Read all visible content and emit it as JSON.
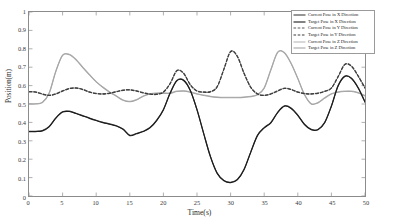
{
  "chart_data": {
    "type": "line",
    "title": "",
    "xlabel": "Time(s)",
    "ylabel": "Position(m)",
    "xlim": [
      0,
      50
    ],
    "ylim": [
      0,
      1
    ],
    "xticks": [
      0,
      5,
      10,
      15,
      20,
      25,
      30,
      35,
      40,
      45,
      50
    ],
    "yticks": [
      0,
      0.1,
      0.2,
      0.3,
      0.4,
      0.5,
      0.6,
      0.7,
      0.8,
      0.9,
      1
    ],
    "ytick_labels": [
      "0",
      "0.1",
      "0.2",
      "0.3",
      "0.4",
      "0.5",
      "0.6",
      "0.7",
      "0.8",
      "0.9",
      "1"
    ],
    "xtick_labels": [
      "0",
      "5",
      "10",
      "15",
      "20",
      "25",
      "30",
      "35",
      "40",
      "45",
      "50"
    ],
    "grid": false,
    "legend_position": "top-right",
    "x": [
      0,
      1,
      2,
      3,
      4,
      5,
      6,
      7,
      8,
      9,
      10,
      11,
      12,
      13,
      14,
      15,
      16,
      17,
      18,
      19,
      20,
      21,
      22,
      23,
      24,
      25,
      26,
      27,
      28,
      29,
      30,
      31,
      32,
      33,
      34,
      35,
      36,
      37,
      38,
      39,
      40,
      41,
      42,
      43,
      44,
      45,
      46,
      47,
      48,
      49,
      50
    ],
    "series": [
      {
        "name": "Current Pose in X Direction",
        "color": "#3f3f3f",
        "style": "solid",
        "values": [
          0.352,
          0.352,
          0.356,
          0.378,
          0.425,
          0.458,
          0.461,
          0.45,
          0.437,
          0.424,
          0.412,
          0.401,
          0.392,
          0.382,
          0.364,
          0.33,
          0.34,
          0.352,
          0.372,
          0.412,
          0.47,
          0.56,
          0.628,
          0.63,
          0.575,
          0.47,
          0.34,
          0.215,
          0.125,
          0.085,
          0.075,
          0.09,
          0.145,
          0.24,
          0.33,
          0.372,
          0.4,
          0.455,
          0.49,
          0.478,
          0.44,
          0.39,
          0.362,
          0.362,
          0.4,
          0.49,
          0.6,
          0.652,
          0.64,
          0.588,
          0.512
        ]
      },
      {
        "name": "Target Pose in X Direction",
        "color": "#1c1c1c",
        "style": "solid",
        "values": [
          0.35,
          0.35,
          0.354,
          0.376,
          0.423,
          0.456,
          0.459,
          0.448,
          0.435,
          0.422,
          0.41,
          0.399,
          0.39,
          0.38,
          0.362,
          0.328,
          0.338,
          0.35,
          0.37,
          0.41,
          0.468,
          0.558,
          0.626,
          0.628,
          0.573,
          0.468,
          0.338,
          0.213,
          0.123,
          0.083,
          0.073,
          0.088,
          0.143,
          0.238,
          0.328,
          0.37,
          0.398,
          0.453,
          0.488,
          0.476,
          0.438,
          0.388,
          0.36,
          0.36,
          0.398,
          0.488,
          0.598,
          0.65,
          0.638,
          0.586,
          0.51
        ]
      },
      {
        "name": "Current Pose in Y Direction",
        "color": "#5a5a5a",
        "style": "dashed",
        "values": [
          0.568,
          0.566,
          0.555,
          0.548,
          0.556,
          0.572,
          0.585,
          0.588,
          0.58,
          0.566,
          0.558,
          0.556,
          0.56,
          0.568,
          0.576,
          0.578,
          0.572,
          0.562,
          0.555,
          0.554,
          0.566,
          0.612,
          0.682,
          0.668,
          0.606,
          0.572,
          0.566,
          0.568,
          0.595,
          0.69,
          0.786,
          0.76,
          0.668,
          0.592,
          0.556,
          0.548,
          0.556,
          0.572,
          0.586,
          0.58,
          0.566,
          0.558,
          0.556,
          0.56,
          0.57,
          0.588,
          0.65,
          0.716,
          0.706,
          0.652,
          0.588
        ]
      },
      {
        "name": "Target Pose in Y Direction",
        "color": "#3d3d3d",
        "style": "dashed",
        "values": [
          0.566,
          0.564,
          0.553,
          0.546,
          0.554,
          0.57,
          0.583,
          0.586,
          0.578,
          0.564,
          0.556,
          0.554,
          0.558,
          0.566,
          0.574,
          0.576,
          0.57,
          0.56,
          0.553,
          0.552,
          0.564,
          0.61,
          0.68,
          0.666,
          0.604,
          0.57,
          0.564,
          0.566,
          0.593,
          0.688,
          0.784,
          0.758,
          0.666,
          0.59,
          0.554,
          0.546,
          0.554,
          0.57,
          0.584,
          0.578,
          0.564,
          0.556,
          0.554,
          0.558,
          0.568,
          0.586,
          0.648,
          0.714,
          0.704,
          0.65,
          0.586
        ]
      },
      {
        "name": "Current Pose in Z Direction",
        "color": "#b8b8b8",
        "style": "solid",
        "values": [
          0.502,
          0.502,
          0.51,
          0.56,
          0.68,
          0.766,
          0.77,
          0.742,
          0.7,
          0.66,
          0.622,
          0.592,
          0.566,
          0.544,
          0.522,
          0.514,
          0.524,
          0.544,
          0.556,
          0.56,
          0.56,
          0.56,
          0.57,
          0.572,
          0.566,
          0.556,
          0.548,
          0.542,
          0.538,
          0.536,
          0.536,
          0.536,
          0.538,
          0.542,
          0.552,
          0.588,
          0.688,
          0.782,
          0.78,
          0.722,
          0.64,
          0.552,
          0.502,
          0.508,
          0.534,
          0.556,
          0.566,
          0.57,
          0.57,
          0.562,
          0.546
        ]
      },
      {
        "name": "Target Pose in Z Direction",
        "color": "#a6a6a6",
        "style": "solid",
        "values": [
          0.5,
          0.5,
          0.508,
          0.558,
          0.678,
          0.764,
          0.768,
          0.74,
          0.698,
          0.658,
          0.62,
          0.59,
          0.564,
          0.542,
          0.52,
          0.512,
          0.522,
          0.542,
          0.554,
          0.558,
          0.558,
          0.558,
          0.568,
          0.57,
          0.564,
          0.554,
          0.546,
          0.54,
          0.536,
          0.534,
          0.534,
          0.534,
          0.536,
          0.54,
          0.55,
          0.586,
          0.686,
          0.78,
          0.778,
          0.72,
          0.638,
          0.55,
          0.5,
          0.506,
          0.532,
          0.554,
          0.564,
          0.568,
          0.568,
          0.56,
          0.544
        ]
      }
    ],
    "legend_entries": [
      {
        "label": "Current Pose in X Direction",
        "color": "#3f3f3f",
        "style": "solid"
      },
      {
        "label": "Target Pose in X Direction",
        "color": "#1c1c1c",
        "style": "solid"
      },
      {
        "label": "Current Pose in Y Direction",
        "color": "#5a5a5a",
        "style": "dashed"
      },
      {
        "label": "Target Pose in Y Direction",
        "color": "#3d3d3d",
        "style": "dashed"
      },
      {
        "label": "Current Pose in Z Direction",
        "color": "#b8b8b8",
        "style": "solid"
      },
      {
        "label": "Target Pose in Z Direction",
        "color": "#a6a6a6",
        "style": "solid"
      }
    ]
  }
}
